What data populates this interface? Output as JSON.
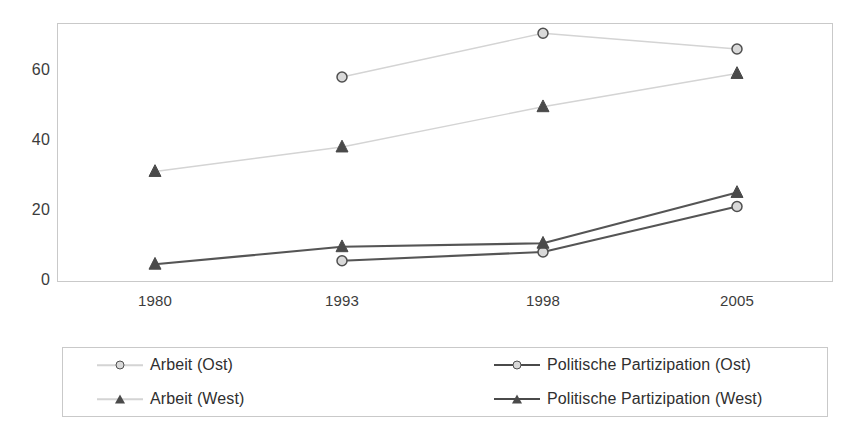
{
  "chart_data": {
    "type": "line",
    "title": "",
    "subtitle": "",
    "xlabel": "",
    "ylabel": "",
    "categories": [
      "1980",
      "1993",
      "1998",
      "2005"
    ],
    "x_positions": [
      155,
      342,
      543,
      737
    ],
    "ylim": [
      0,
      75
    ],
    "yticks": [
      0,
      20,
      40,
      60
    ],
    "ytick_labels": [
      "0",
      "20",
      "40",
      "60"
    ],
    "grid": false,
    "legend_position": "bottom",
    "series": [
      {
        "name": "Arbeit (Ost)",
        "marker": "circle",
        "line_color": "#d4d4d4",
        "marker_fill": "#d9d9d9",
        "marker_edge": "#4f4f4f",
        "line_width": 1.4,
        "values": [
          null,
          58,
          70.5,
          66
        ]
      },
      {
        "name": "Arbeit (West)",
        "marker": "triangle",
        "line_color": "#d4d4d4",
        "marker_fill": "#4a4a4a",
        "marker_edge": "#4a4a4a",
        "line_width": 1.4,
        "values": [
          31,
          38,
          49.5,
          59
        ]
      },
      {
        "name": "Politische Partizipation (Ost)",
        "marker": "circle",
        "line_color": "#555555",
        "marker_fill": "#d9d9d9",
        "marker_edge": "#4f4f4f",
        "line_width": 2.2,
        "values": [
          null,
          5.5,
          8,
          21
        ]
      },
      {
        "name": "Politische Partizipation (West)",
        "marker": "triangle",
        "line_color": "#555555",
        "marker_fill": "#4a4a4a",
        "marker_edge": "#4a4a4a",
        "line_width": 2.2,
        "values": [
          4.5,
          9.5,
          10.5,
          25
        ]
      }
    ]
  },
  "legend": {
    "items": [
      {
        "label": "Arbeit (Ost)",
        "marker": "circle",
        "line": "light"
      },
      {
        "label": "Politische Partizipation (Ost)",
        "marker": "circle",
        "line": "dark"
      },
      {
        "label": "Arbeit (West)",
        "marker": "triangle",
        "line": "light"
      },
      {
        "label": "Politische Partizipation (West)",
        "marker": "triangle",
        "line": "dark"
      }
    ]
  },
  "colors": {
    "frame": "#c9c9c9",
    "light_line": "#d4d4d4",
    "dark_line": "#555555",
    "text": "#3a3a3a"
  }
}
